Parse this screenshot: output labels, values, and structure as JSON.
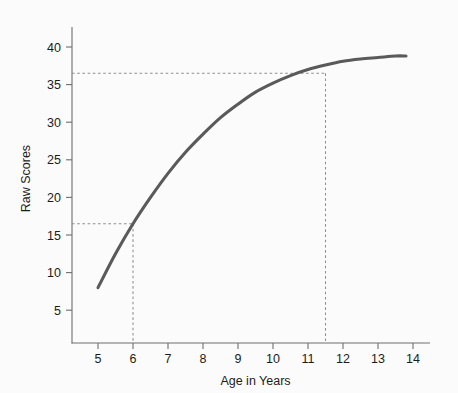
{
  "chart_data": {
    "type": "line",
    "title": "",
    "xlabel": "Age in Years",
    "ylabel": "Raw Scores",
    "xlim": [
      4.4,
      14.6
    ],
    "ylim": [
      0,
      42.5
    ],
    "grid": false,
    "legend": "none",
    "x_ticks": [
      5,
      6,
      7,
      8,
      9,
      10,
      11,
      12,
      13,
      14
    ],
    "x_tick_labels": [
      "5",
      "6",
      "7",
      "8",
      "9",
      "10",
      "11",
      "12",
      "13",
      "14"
    ],
    "y_ticks": [
      5,
      10,
      15,
      20,
      25,
      30,
      35,
      40
    ],
    "y_tick_labels": [
      "5",
      "10",
      "15",
      "20",
      "25",
      "30",
      "35",
      "40"
    ],
    "series": [
      {
        "name": "Raw score growth curve",
        "color": "#5a5a5a",
        "x": [
          5.0,
          5.5,
          6.0,
          6.5,
          7.0,
          7.5,
          8.0,
          8.5,
          9.0,
          9.5,
          10.0,
          10.5,
          11.0,
          11.5,
          12.0,
          12.5,
          13.0,
          13.5,
          13.8
        ],
        "values": [
          8.0,
          12.5,
          16.5,
          20.0,
          23.2,
          26.0,
          28.4,
          30.6,
          32.4,
          34.0,
          35.2,
          36.2,
          37.0,
          37.6,
          38.1,
          38.4,
          38.6,
          38.8,
          38.8
        ]
      }
    ],
    "annotations": [
      {
        "name": "lower-reference",
        "type": "crosshair",
        "x": 6.0,
        "y": 16.5,
        "style": "dashed",
        "color": "#8e8e8e"
      },
      {
        "name": "upper-reference",
        "type": "crosshair",
        "x": 11.5,
        "y": 36.5,
        "style": "dashed",
        "color": "#8e8e8e"
      }
    ]
  },
  "colors": {
    "background": "#fbfbfb",
    "curve": "#5a5a5a",
    "axis": "#6e6e6e",
    "reference": "#8e8e8e",
    "text": "#1c1c1c"
  }
}
